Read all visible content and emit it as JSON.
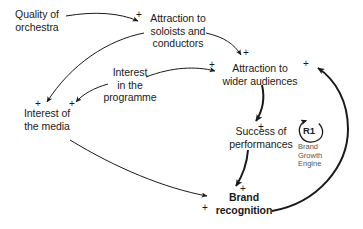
{
  "diagram": {
    "type": "causal-loop-diagram",
    "background_color": "#ffffff",
    "line_color": "#1a1a1a",
    "caption_color": "#555555",
    "nodes": [
      {
        "id": "quality",
        "label": "Quality of\norchestra",
        "bold": false
      },
      {
        "id": "soloists",
        "label": "Attraction to\nsoloists and\nconductors",
        "bold": false
      },
      {
        "id": "programme",
        "label": "Interest\nin the\nprogramme",
        "bold": false
      },
      {
        "id": "audiences",
        "label": "Attraction to\nwider audiences",
        "bold": false
      },
      {
        "id": "media",
        "label": "Interest of\nthe media",
        "bold": false
      },
      {
        "id": "success",
        "label": "Success of\nperformances",
        "bold": false
      },
      {
        "id": "brand",
        "label": "Brand\nrecognition",
        "bold": true
      }
    ],
    "links": [
      {
        "id": "quality-to-soloists",
        "from": "quality",
        "to": "soloists",
        "polarity": "+"
      },
      {
        "id": "soloists-to-audiences",
        "from": "soloists",
        "to": "audiences",
        "polarity": "+"
      },
      {
        "id": "soloists-to-media",
        "from": "soloists",
        "to": "media",
        "polarity": "+"
      },
      {
        "id": "programme-to-audiences",
        "from": "programme",
        "to": "audiences",
        "polarity": "+"
      },
      {
        "id": "programme-to-media",
        "from": "programme",
        "to": "media",
        "polarity": "+"
      },
      {
        "id": "audiences-to-success",
        "from": "audiences",
        "to": "success",
        "polarity": "+"
      },
      {
        "id": "success-to-brand",
        "from": "success",
        "to": "brand",
        "polarity": "+"
      },
      {
        "id": "media-to-brand",
        "from": "media",
        "to": "brand",
        "polarity": "+"
      },
      {
        "id": "brand-to-audiences",
        "from": "brand",
        "to": "audiences",
        "polarity": "+"
      }
    ],
    "polarity_marks": [
      {
        "id": "p-quality-soloists",
        "sign": "+"
      },
      {
        "id": "p-soloists-audiences",
        "sign": "+"
      },
      {
        "id": "p-programme-audiences",
        "sign": "+"
      },
      {
        "id": "p-brand-audiences",
        "sign": "+"
      },
      {
        "id": "p-soloists-media",
        "sign": "+"
      },
      {
        "id": "p-programme-media",
        "sign": "+"
      },
      {
        "id": "p-audiences-success",
        "sign": "+"
      },
      {
        "id": "p-success-brand",
        "sign": "+"
      },
      {
        "id": "p-media-brand",
        "sign": "+"
      }
    ],
    "loop": {
      "id": "R1",
      "label": "R1",
      "caption": "Brand\nGrowth\nEngine",
      "direction": "reinforcing"
    }
  }
}
